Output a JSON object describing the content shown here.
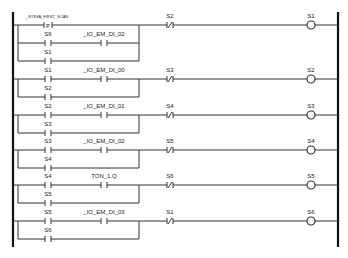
{
  "diagram": {
    "type": "ladder-logic",
    "rungs": [
      {
        "y": 25,
        "main_contact": {
          "label": "_SYSVA_FIRST_SCAN",
          "type": "P"
        },
        "series_contact": null,
        "branches": [
          {
            "label": "S6",
            "series": {
              "label": "_IO_EM_DI_02",
              "type": "NO"
            }
          },
          {
            "label": "S1"
          }
        ],
        "nc_contact": {
          "label": "S2"
        },
        "coil": {
          "label": "S1"
        }
      },
      {
        "y": 79,
        "main_contact": {
          "label": "S1",
          "type": "NO"
        },
        "series_contact": {
          "label": "_IO_EM_DI_00",
          "type": "NO"
        },
        "branches": [
          {
            "label": "S2"
          }
        ],
        "nc_contact": {
          "label": "S3"
        },
        "coil": {
          "label": "S2"
        }
      },
      {
        "y": 115,
        "main_contact": {
          "label": "S2",
          "type": "NO"
        },
        "series_contact": {
          "label": "_IO_EM_DI_01",
          "type": "NO"
        },
        "branches": [
          {
            "label": "S3"
          }
        ],
        "nc_contact": {
          "label": "S4"
        },
        "coil": {
          "label": "S3"
        }
      },
      {
        "y": 150,
        "main_contact": {
          "label": "S3",
          "type": "NO"
        },
        "series_contact": {
          "label": "_IO_EM_DI_02",
          "type": "NO"
        },
        "branches": [
          {
            "label": "S4"
          }
        ],
        "nc_contact": {
          "label": "S5"
        },
        "coil": {
          "label": "S4"
        }
      },
      {
        "y": 185,
        "main_contact": {
          "label": "S4",
          "type": "NO"
        },
        "series_contact": {
          "label": "TON_1.Q",
          "type": "NO"
        },
        "branches": [
          {
            "label": "S5"
          }
        ],
        "nc_contact": {
          "label": "S6"
        },
        "coil": {
          "label": "S5"
        }
      },
      {
        "y": 221,
        "main_contact": {
          "label": "S5",
          "type": "NO"
        },
        "series_contact": {
          "label": "_IO_EM_DI_03",
          "type": "NO"
        },
        "branches": [
          {
            "label": "S6"
          }
        ],
        "nc_contact": {
          "label": "S1"
        },
        "coil": {
          "label": "S6"
        }
      }
    ]
  }
}
